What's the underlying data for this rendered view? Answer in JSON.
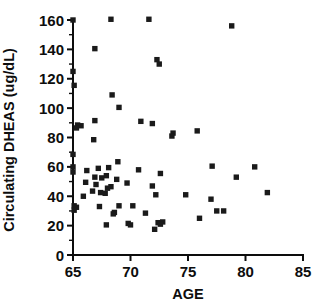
{
  "chart_data": {
    "type": "scatter",
    "title": "",
    "xlabel": "AGE",
    "ylabel": "Circulating DHEAS (ug/dL)",
    "xlim": [
      65,
      85
    ],
    "ylim": [
      0,
      160
    ],
    "grid": false,
    "legend": "none",
    "marker_style": "filled-square",
    "marker_color": "#1a1a1a",
    "xticks": [
      65,
      70,
      75,
      80,
      85
    ],
    "xtick_labels": [
      "65",
      "70",
      "75",
      "80",
      "85"
    ],
    "yticks": [
      0,
      20,
      40,
      60,
      80,
      100,
      120,
      140,
      160
    ],
    "ytick_labels": [
      "0",
      "20",
      "40",
      "60",
      "80",
      "100",
      "120",
      "140",
      "160"
    ],
    "y_minor_ticks": [
      10,
      30,
      50,
      70,
      90,
      110,
      130,
      150
    ],
    "x_minor_ticks": [],
    "points": [
      [
        65.0,
        160.0
      ],
      [
        68.3,
        160.5
      ],
      [
        71.6,
        160.5
      ],
      [
        78.8,
        156.0
      ],
      [
        66.9,
        140.5
      ],
      [
        65.0,
        125.0
      ],
      [
        65.1,
        115.5
      ],
      [
        72.3,
        133.0
      ],
      [
        72.5,
        130.0
      ],
      [
        68.4,
        109.0
      ],
      [
        69.0,
        100.5
      ],
      [
        66.9,
        91.5
      ],
      [
        70.9,
        91.0
      ],
      [
        71.9,
        89.5
      ],
      [
        65.4,
        88.5
      ],
      [
        65.7,
        88.0
      ],
      [
        65.3,
        86.5
      ],
      [
        75.8,
        84.5
      ],
      [
        73.7,
        83.0
      ],
      [
        73.6,
        81.0
      ],
      [
        66.8,
        78.5
      ],
      [
        65.0,
        68.5
      ],
      [
        65.0,
        60.0
      ],
      [
        65.0,
        56.5
      ],
      [
        68.9,
        63.5
      ],
      [
        68.1,
        59.5
      ],
      [
        67.2,
        59.0
      ],
      [
        70.7,
        58.0
      ],
      [
        66.2,
        57.5
      ],
      [
        80.8,
        60.0
      ],
      [
        77.1,
        60.5
      ],
      [
        72.6,
        55.5
      ],
      [
        67.9,
        54.0
      ],
      [
        66.9,
        53.0
      ],
      [
        67.5,
        52.5
      ],
      [
        68.8,
        51.5
      ],
      [
        79.2,
        53.0
      ],
      [
        66.1,
        49.5
      ],
      [
        69.7,
        49.0
      ],
      [
        67.0,
        48.0
      ],
      [
        68.3,
        46.5
      ],
      [
        68.0,
        45.5
      ],
      [
        71.9,
        47.0
      ],
      [
        66.7,
        43.5
      ],
      [
        67.4,
        42.5
      ],
      [
        67.8,
        42.0
      ],
      [
        72.2,
        41.0
      ],
      [
        74.8,
        41.0
      ],
      [
        81.9,
        42.5
      ],
      [
        65.9,
        40.0
      ],
      [
        77.0,
        38.0
      ],
      [
        65.1,
        33.5
      ],
      [
        65.3,
        32.5
      ],
      [
        65.1,
        30.5
      ],
      [
        67.3,
        33.0
      ],
      [
        69.0,
        33.5
      ],
      [
        70.2,
        33.5
      ],
      [
        68.6,
        29.0
      ],
      [
        71.3,
        28.5
      ],
      [
        77.5,
        30.0
      ],
      [
        78.1,
        30.0
      ],
      [
        76.0,
        25.0
      ],
      [
        68.5,
        28.0
      ],
      [
        67.9,
        20.5
      ],
      [
        69.8,
        21.5
      ],
      [
        70.0,
        20.5
      ],
      [
        72.4,
        22.0
      ],
      [
        72.8,
        22.5
      ],
      [
        72.6,
        21.0
      ],
      [
        72.1,
        17.5
      ]
    ]
  }
}
